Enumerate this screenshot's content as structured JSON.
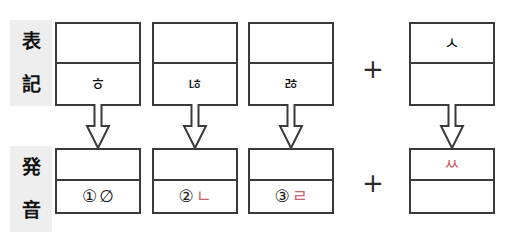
{
  "labels": {
    "notation": {
      "char1": "表",
      "char2": "記"
    },
    "pronunciation": {
      "char1": "発",
      "char2": "音"
    }
  },
  "operators": {
    "plus_top": "+",
    "plus_bottom": "+"
  },
  "notation_row": {
    "boxes": [
      {
        "top": "",
        "bottom": "ㅎ"
      },
      {
        "top": "",
        "bottom": "ㄶ"
      },
      {
        "top": "",
        "bottom": "ㅀ"
      },
      {
        "top": "ㅅ",
        "bottom": ""
      }
    ]
  },
  "pronunciation_row": {
    "boxes": [
      {
        "top": "",
        "number": "①",
        "jamo": "∅",
        "jamo_color": "#1a1a1a"
      },
      {
        "top": "",
        "number": "②",
        "jamo": "ㄴ",
        "jamo_color": "#c4666e"
      },
      {
        "top": "",
        "number": "③",
        "jamo": "ㄹ",
        "jamo_color": "#c4666e"
      },
      {
        "top": "ㅆ",
        "number": "",
        "jamo": "",
        "jamo_color": "#c4666e"
      }
    ]
  },
  "arrows": {
    "icon": "down-arrow-outline",
    "count": 4
  },
  "colors": {
    "border": "#3a3a3a",
    "label_bg": "#eeeeee",
    "red_accent": "#c4666e",
    "text": "#111111"
  }
}
